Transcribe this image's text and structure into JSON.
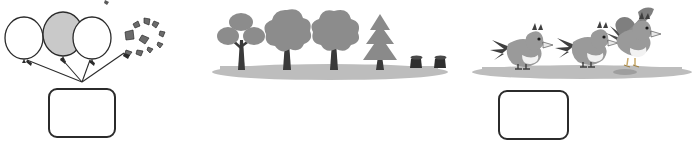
{
  "worksheet": {
    "type": "picture-subtraction",
    "problem_count": 3,
    "answer_placeholder": ""
  },
  "colors": {
    "outline": "#2b2b2b",
    "balloon_fill_shaded": "#c9c9c9",
    "balloon_fill_plain": "#ffffff",
    "foliage": "#8c8c8c",
    "foliage_dark": "#7a7a7a",
    "trunk": "#3a3a3a",
    "ground": "#bdbdbd",
    "bird_body": "#9a9a9a",
    "bird_belly": "#f2f2f2",
    "bird_dark": "#4a4a4a",
    "box_border": "#2b2b2b",
    "page_background": "#ffffff"
  },
  "problems": [
    {
      "id": "problem-1",
      "theme": "balloons",
      "total_label": "3",
      "objects": [
        {
          "name": "balloon",
          "state": "whole",
          "fill": "plain"
        },
        {
          "name": "balloon",
          "state": "whole",
          "fill": "shaded"
        },
        {
          "name": "balloon",
          "state": "whole",
          "fill": "plain"
        },
        {
          "name": "balloon",
          "state": "popped",
          "fill": "burst"
        }
      ],
      "whole_count": "3",
      "removed_count": "1",
      "arrow_count": "4",
      "answer": ""
    },
    {
      "id": "problem-2",
      "theme": "trees",
      "total_label": "4",
      "objects": [
        {
          "name": "tree",
          "state": "standing",
          "shape": "three-blob"
        },
        {
          "name": "tree",
          "state": "standing",
          "shape": "cloud"
        },
        {
          "name": "tree",
          "state": "standing",
          "shape": "cloud"
        },
        {
          "name": "tree",
          "state": "standing",
          "shape": "conifer"
        },
        {
          "name": "stump",
          "state": "cut",
          "shape": "stump"
        },
        {
          "name": "stump",
          "state": "cut",
          "shape": "stump"
        }
      ],
      "whole_count": "4",
      "removed_count": "2",
      "answer": ""
    },
    {
      "id": "problem-3",
      "theme": "birds",
      "total_label": "3",
      "objects": [
        {
          "name": "bird",
          "state": "perched"
        },
        {
          "name": "bird",
          "state": "perched"
        },
        {
          "name": "bird",
          "state": "flying-away"
        }
      ],
      "whole_count": "2",
      "removed_count": "1",
      "answer": ""
    }
  ]
}
